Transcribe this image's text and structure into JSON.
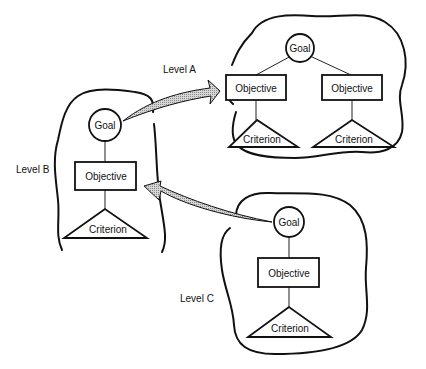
{
  "diagram": {
    "levels": [
      {
        "id": "A",
        "label": "Level A",
        "goal": "Goal",
        "objectives": [
          "Objective",
          "Objective"
        ],
        "criteria": [
          "Criterion",
          "Criterion"
        ]
      },
      {
        "id": "B",
        "label": "Level B",
        "goal": "Goal",
        "objectives": [
          "Objective"
        ],
        "criteria": [
          "Criterion"
        ]
      },
      {
        "id": "C",
        "label": "Level C",
        "goal": "Goal",
        "objectives": [
          "Objective"
        ],
        "criteria": [
          "Criterion"
        ]
      }
    ],
    "arrows": [
      {
        "from": "Level B Goal",
        "to": "Level A"
      },
      {
        "from": "Level C Goal",
        "to": "Level B"
      }
    ],
    "colors": {
      "line": "#111111",
      "arrow_fill": "#bdbdbd",
      "background": "#ffffff"
    }
  }
}
